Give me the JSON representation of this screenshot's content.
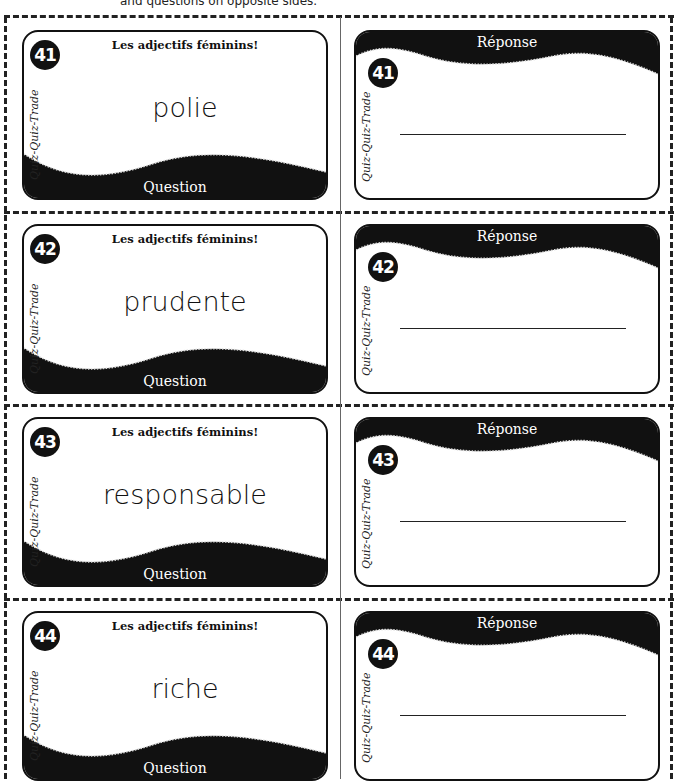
{
  "header": {
    "note": "and questions on opposite sides."
  },
  "brand_label": "Quiz-Quiz-Trade",
  "question_title": "Les adjectifs féminins!",
  "question_band_label": "Question",
  "answer_band_label": "Réponse",
  "cards": [
    {
      "number": "41",
      "word": "polie"
    },
    {
      "number": "42",
      "word": "prudente"
    },
    {
      "number": "43",
      "word": "responsable"
    },
    {
      "number": "44",
      "word": "riche"
    }
  ],
  "colors": {
    "card_border": "#111111",
    "band": "#111111",
    "cut_line": "#222222",
    "background": "#ffffff"
  }
}
